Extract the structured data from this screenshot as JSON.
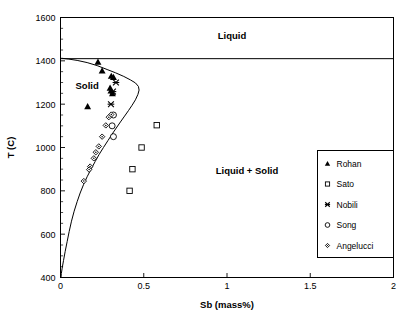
{
  "chart_data": {
    "type": "scatter",
    "title": "",
    "xlabel": "Sb (mass%)",
    "ylabel": "T (C)",
    "xlim": [
      0,
      2
    ],
    "ylim": [
      400,
      1600
    ],
    "xticks": [
      "0",
      "0.5",
      "1",
      "1.5",
      "2"
    ],
    "xtick_values": [
      0,
      0.5,
      1,
      1.5,
      2
    ],
    "yticks": [
      "400",
      "600",
      "800",
      "1000",
      "1200",
      "1400",
      "1600"
    ],
    "ytick_values": [
      400,
      600,
      800,
      1000,
      1200,
      1400,
      1600
    ],
    "y_minor_step": 50,
    "grid": false,
    "legend_position": "right-lower",
    "annotations": [
      {
        "text": "Liquid",
        "x": 1.03,
        "y": 1500
      },
      {
        "text": "Solid",
        "x": 0.16,
        "y": 1270
      },
      {
        "text": "Liquid + Solid",
        "x": 1.12,
        "y": 880
      }
    ],
    "lines": [
      {
        "name": "liquidus-horizontal",
        "comment": "horizontal line at 1410 C spanning full width",
        "points": [
          [
            0.0,
            1410
          ],
          [
            2.0,
            1410
          ]
        ]
      },
      {
        "name": "solvus-curve",
        "comment": "solid solubility boundary, nose near 0.47 mass% at ~1290 C",
        "points": [
          [
            0.005,
            1412
          ],
          [
            0.05,
            1408
          ],
          [
            0.1,
            1402
          ],
          [
            0.16,
            1392
          ],
          [
            0.22,
            1378
          ],
          [
            0.28,
            1360
          ],
          [
            0.33,
            1345
          ],
          [
            0.38,
            1328
          ],
          [
            0.42,
            1312
          ],
          [
            0.45,
            1298
          ],
          [
            0.468,
            1282
          ],
          [
            0.472,
            1265
          ],
          [
            0.465,
            1245
          ],
          [
            0.45,
            1220
          ],
          [
            0.43,
            1195
          ],
          [
            0.408,
            1170
          ],
          [
            0.385,
            1145
          ],
          [
            0.36,
            1118
          ],
          [
            0.335,
            1090
          ],
          [
            0.31,
            1062
          ],
          [
            0.285,
            1032
          ],
          [
            0.258,
            1000
          ],
          [
            0.232,
            968
          ],
          [
            0.208,
            935
          ],
          [
            0.185,
            902
          ],
          [
            0.16,
            865
          ],
          [
            0.138,
            828
          ],
          [
            0.118,
            790
          ],
          [
            0.1,
            750
          ],
          [
            0.082,
            706
          ],
          [
            0.066,
            660
          ],
          [
            0.052,
            612
          ],
          [
            0.04,
            566
          ],
          [
            0.028,
            520
          ],
          [
            0.018,
            478
          ],
          [
            0.01,
            443
          ],
          [
            0.005,
            418
          ],
          [
            0.003,
            400
          ]
        ]
      }
    ],
    "series": [
      {
        "name": "Rohan",
        "marker": "filled-triangle",
        "points": [
          [
            0.225,
            1395
          ],
          [
            0.25,
            1355
          ],
          [
            0.305,
            1330
          ],
          [
            0.318,
            1325
          ],
          [
            0.298,
            1275
          ],
          [
            0.303,
            1262
          ],
          [
            0.312,
            1250
          ],
          [
            0.163,
            1190
          ]
        ]
      },
      {
        "name": "Sato",
        "marker": "open-square",
        "points": [
          [
            0.578,
            1103
          ],
          [
            0.487,
            1000
          ],
          [
            0.432,
            900
          ],
          [
            0.415,
            800
          ]
        ]
      },
      {
        "name": "Nobili",
        "marker": "x-cross",
        "points": [
          [
            0.333,
            1300
          ],
          [
            0.315,
            1258
          ],
          [
            0.303,
            1200
          ]
        ]
      },
      {
        "name": "Song",
        "marker": "open-circle",
        "points": [
          [
            0.318,
            1150
          ],
          [
            0.31,
            1100
          ],
          [
            0.318,
            1050
          ]
        ]
      },
      {
        "name": "Angelucci",
        "marker": "open-diamond",
        "points": [
          [
            0.305,
            1152
          ],
          [
            0.29,
            1140
          ],
          [
            0.272,
            1102
          ],
          [
            0.25,
            1050
          ],
          [
            0.23,
            1005
          ],
          [
            0.212,
            978
          ],
          [
            0.2,
            950
          ],
          [
            0.178,
            912
          ],
          [
            0.172,
            898
          ],
          [
            0.14,
            845
          ]
        ]
      }
    ]
  },
  "legend": {
    "entries": [
      {
        "label": "Rohan",
        "marker": "filled-triangle"
      },
      {
        "label": "Sato",
        "marker": "open-square"
      },
      {
        "label": "Nobili",
        "marker": "x-cross"
      },
      {
        "label": "Song",
        "marker": "open-circle"
      },
      {
        "label": "Angelucci",
        "marker": "open-diamond"
      }
    ]
  }
}
